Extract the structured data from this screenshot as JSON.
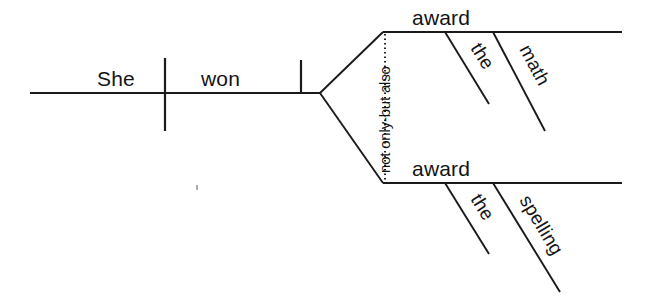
{
  "diagram": {
    "type": "reed-kellogg-sentence-diagram",
    "sentence": "She won not only the math award but also the spelling award.",
    "baseline": {
      "subject": "She",
      "verb": "won"
    },
    "conjunction": {
      "label": "not only-but also"
    },
    "branches": [
      {
        "position": "upper",
        "head": "award",
        "modifiers": [
          {
            "label": "the"
          },
          {
            "label": "math"
          }
        ]
      },
      {
        "position": "lower",
        "head": "award",
        "modifiers": [
          {
            "label": "the"
          },
          {
            "label": "spelling"
          }
        ]
      }
    ],
    "colors": {
      "ink": "#1a1a1a",
      "text": "#141414",
      "background": "#ffffff"
    }
  }
}
